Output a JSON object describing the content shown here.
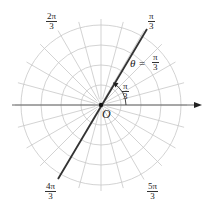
{
  "diagram": {
    "origin_label": "O",
    "equation": {
      "lhs": "θ =",
      "num": "π",
      "den": "3"
    },
    "angle_marker": {
      "num": "π",
      "den": "3"
    },
    "ray_labels": [
      {
        "id": "pi-over-3",
        "num": "π",
        "den": "3"
      },
      {
        "id": "2pi-over-3",
        "num": "2π",
        "den": "3"
      },
      {
        "id": "4pi-over-3",
        "num": "4π",
        "den": "3"
      },
      {
        "id": "5pi-over-3",
        "num": "5π",
        "den": "3"
      }
    ],
    "grid": {
      "circle_radii_px": [
        20,
        40,
        60,
        80
      ],
      "radial_step_degrees": 15
    },
    "colors": {
      "grid": "#c8c8c8",
      "line": "#333333",
      "axis": "#555555",
      "text": "#222222"
    }
  }
}
